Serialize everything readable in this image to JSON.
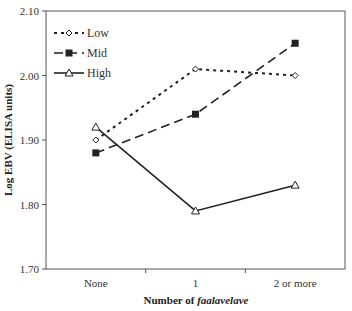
{
  "chart_data": {
    "type": "line",
    "title": "",
    "xlabel": "Number of faalavelave",
    "xlabel_prefix": "Number of ",
    "xlabel_italic": "faalavelave",
    "ylabel": "Log EBV (ELISA units)",
    "ylim": [
      1.7,
      2.1
    ],
    "yticks": [
      1.7,
      1.8,
      1.9,
      2.0,
      2.1
    ],
    "ytick_labels": [
      "1.70",
      "1.80",
      "1.90",
      "2.00",
      "2.10"
    ],
    "categories": [
      "None",
      "1",
      "2 or more"
    ],
    "grid": false,
    "legend_position": "upper-left",
    "series": [
      {
        "name": "Low",
        "values": [
          1.9,
          2.01,
          2.0
        ],
        "line_style": "dotted",
        "marker": "open-diamond",
        "color": "#222222"
      },
      {
        "name": "Mid",
        "values": [
          1.88,
          1.94,
          2.05
        ],
        "line_style": "dashed",
        "marker": "filled-square",
        "color": "#222222"
      },
      {
        "name": "High",
        "values": [
          1.92,
          1.79,
          1.83
        ],
        "line_style": "solid",
        "marker": "open-triangle",
        "color": "#222222"
      }
    ]
  }
}
